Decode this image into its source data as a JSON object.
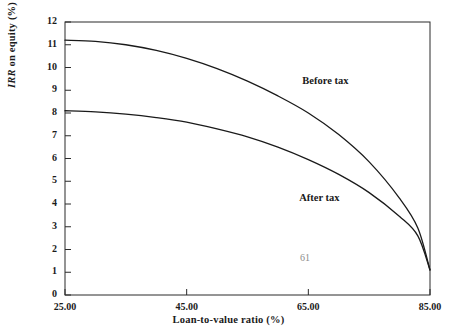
{
  "chart_data": {
    "type": "line",
    "title": "",
    "xlabel": "Loan-to-value ratio (%)",
    "ylabel": "IRR on equity (%)",
    "ylabel_italic_part": "IRR",
    "ylabel_rest": " on equity (%)",
    "xlim": [
      25,
      85
    ],
    "ylim": [
      0,
      12
    ],
    "grid": false,
    "legend_position": "inline-annotation",
    "xticks": [
      25,
      45,
      65,
      85
    ],
    "xtick_labels": [
      "25.00",
      "45.00",
      "65.00",
      "85.00"
    ],
    "yticks": [
      0,
      1,
      2,
      3,
      4,
      5,
      6,
      7,
      8,
      9,
      10,
      11,
      12
    ],
    "ytick_labels": [
      "0",
      "1",
      "2",
      "3",
      "4",
      "5",
      "6",
      "7",
      "8",
      "9",
      "10",
      "11",
      "12"
    ],
    "x": [
      25,
      30,
      35,
      40,
      45,
      50,
      55,
      60,
      65,
      70,
      75,
      80,
      83,
      85
    ],
    "series": [
      {
        "name": "Before tax",
        "color": "#1a1a1a",
        "values": [
          11.2,
          11.15,
          11.0,
          10.75,
          10.4,
          9.95,
          9.4,
          8.75,
          8.0,
          7.05,
          5.85,
          4.25,
          2.95,
          1.1
        ]
      },
      {
        "name": "After tax",
        "color": "#1a1a1a",
        "values": [
          8.1,
          8.05,
          7.95,
          7.8,
          7.6,
          7.3,
          6.95,
          6.5,
          5.95,
          5.3,
          4.5,
          3.45,
          2.6,
          1.1
        ]
      }
    ],
    "annotations": [
      {
        "text": "Before tax",
        "x": 64.0,
        "y": 9.35
      },
      {
        "text": "After tax",
        "x": 63.5,
        "y": 4.2
      }
    ],
    "page_number": "61"
  }
}
